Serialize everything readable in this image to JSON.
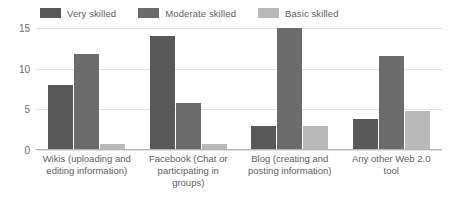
{
  "chart_data": {
    "type": "bar",
    "title": "",
    "subtitle": "",
    "xlabel": "",
    "ylabel": "",
    "ylim": [
      0,
      15
    ],
    "yticks": [
      0,
      5,
      10,
      15
    ],
    "grid": true,
    "legend_position": "top",
    "categories": [
      "Wikis (uploading and editing information)",
      "Facebook (Chat or participating in groups)",
      "Blog (creating and posting information)",
      "Any other Web 2.0 tool"
    ],
    "series": [
      {
        "name": "Very skilled",
        "color": "#595959",
        "values": [
          8,
          14,
          3,
          3.8
        ]
      },
      {
        "name": "Moderate skilled",
        "color": "#6b6b6b",
        "values": [
          11.8,
          5.8,
          15,
          11.6
        ]
      },
      {
        "name": "Basic skilled",
        "color": "#b9b9b9",
        "values": [
          0.8,
          0.8,
          3,
          4.8
        ]
      }
    ]
  },
  "legend": {
    "items": [
      {
        "label": "Very skilled"
      },
      {
        "label": "Moderate skilled"
      },
      {
        "label": "Basic skilled"
      }
    ]
  },
  "axis": {
    "ytick_labels": [
      "0",
      "5",
      "10",
      "15"
    ]
  },
  "colors": {
    "series_1": "#595959",
    "series_2": "#6b6b6b",
    "series_3": "#b9b9b9",
    "gridline": "#e2e2e2",
    "axis": "#b4b4b4",
    "text": "#5e5e5e",
    "background": "#ffffff"
  }
}
